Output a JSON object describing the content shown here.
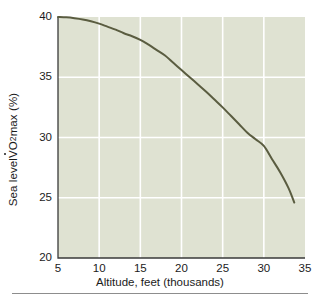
{
  "chart_data": {
    "type": "line",
    "title": "",
    "subtitle": "",
    "xlabel": "Altitude, feet (thousands)",
    "ylabel_parts": {
      "prefix": "Sea level ",
      "vdot": "V",
      "o": "O",
      "sub": "2",
      "suffix": "max (%)"
    },
    "ylabel": "Sea level VO2max (%)",
    "xlim": [
      5,
      35
    ],
    "ylim": [
      20,
      40
    ],
    "xticks": [
      5,
      10,
      15,
      20,
      25,
      30,
      35
    ],
    "yticks": [
      20,
      25,
      30,
      35,
      40
    ],
    "grid": "both-white-lines",
    "legend": "none",
    "series": [
      {
        "name": "Sea level VO2max vs altitude",
        "x": [
          5,
          6,
          7,
          8,
          9,
          10,
          11,
          12,
          13,
          14,
          15,
          16,
          17,
          18,
          19,
          20,
          21,
          22,
          23,
          24,
          25,
          26,
          27,
          28,
          29,
          30,
          31,
          32,
          33,
          33.7
        ],
        "y": [
          40.0,
          39.97,
          39.9,
          39.8,
          39.65,
          39.45,
          39.2,
          38.95,
          38.65,
          38.4,
          38.1,
          37.7,
          37.25,
          36.8,
          36.2,
          35.6,
          35.0,
          34.4,
          33.8,
          33.15,
          32.5,
          31.8,
          31.1,
          30.4,
          29.85,
          29.3,
          28.2,
          27.1,
          25.8,
          24.6
        ]
      }
    ]
  },
  "style": {
    "plot_background": "#dfe2d2",
    "grid_color": "#ffffff",
    "line_color": "#5a5c40",
    "axis_color": "#3a3a3a",
    "text_color": "#1b1b1b",
    "page_background": "#ffffff",
    "rule_color": "#8d8d8d"
  },
  "geometry": {
    "plot_left": 58,
    "plot_right": 305,
    "plot_top": 17,
    "plot_bottom": 258
  }
}
